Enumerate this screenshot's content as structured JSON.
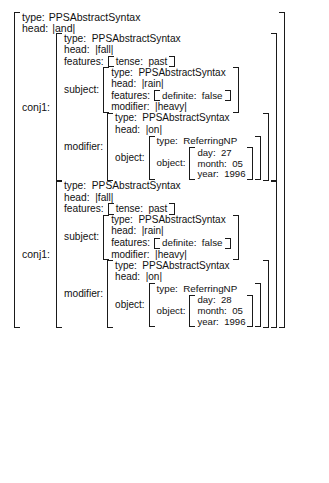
{
  "diagram": {
    "kind": "attribute-value-matrix",
    "background_color": "#ffffff",
    "text_color": "#111111",
    "bracket_color": "#1a1a1a"
  },
  "labels": {
    "type": "type:",
    "head": "head:",
    "features": "features:",
    "subject": "subject:",
    "modifier": "modifier:",
    "object": "object:",
    "conj": "conj1:",
    "day": "day:",
    "month": "month:",
    "year": "year:",
    "tense": "tense:",
    "definite": "definite:"
  },
  "root": {
    "type": "PPSAbstractSyntax",
    "head": "|and|"
  },
  "conjuncts": [
    {
      "label": "conj1:",
      "type": "PPSAbstractSyntax",
      "head": "|fall|",
      "features": {
        "tense": "past"
      },
      "subject": {
        "type": "PPSAbstractSyntax",
        "head": "|rain|",
        "features": {
          "definite": "false"
        },
        "modifier": "|heavy|"
      },
      "modifier": {
        "type": "PPSAbstractSyntax",
        "head": "|on|",
        "object": {
          "type": "ReferringNP",
          "object": {
            "day": "27",
            "month": "05",
            "year": "1996"
          }
        }
      }
    },
    {
      "label": "conj1:",
      "type": "PPSAbstractSyntax",
      "head": "|fall|",
      "features": {
        "tense": "past"
      },
      "subject": {
        "type": "PPSAbstractSyntax",
        "head": "|rain|",
        "features": {
          "definite": "false"
        },
        "modifier": "|heavy|"
      },
      "modifier": {
        "type": "PPSAbstractSyntax",
        "head": "|on|",
        "object": {
          "type": "ReferringNP",
          "object": {
            "day": "28",
            "month": "05",
            "year": "1996"
          }
        }
      }
    }
  ]
}
